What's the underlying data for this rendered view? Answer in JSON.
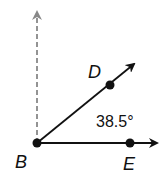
{
  "diagram": {
    "type": "angle",
    "points": {
      "B": {
        "label": "B",
        "x": 37,
        "y": 143
      },
      "D": {
        "label": "D",
        "x": 110,
        "y": 85
      },
      "E": {
        "label": "E",
        "x": 130,
        "y": 143
      }
    },
    "rays": [
      {
        "name": "BD",
        "from": "B",
        "through": "D"
      },
      {
        "name": "BE",
        "from": "B",
        "through": "E"
      },
      {
        "name": "vertical",
        "from": "B",
        "style": "dashed",
        "direction": "up"
      }
    ],
    "angle_label": "38.5°",
    "colors": {
      "ray": "#111111",
      "dashed": "#888888"
    }
  }
}
